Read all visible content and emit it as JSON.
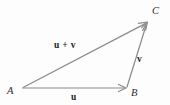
{
  "figure": {
    "background_color": "#fdfdfd",
    "line_color": "#8a8a8a",
    "label_color": "#2b2b2b",
    "width": 170,
    "height": 105
  },
  "vertices": [
    {
      "name": "A",
      "label": "A",
      "x": 22,
      "y": 88,
      "label_x": 8,
      "label_y": 93
    },
    {
      "name": "B",
      "label": "B",
      "x": 127,
      "y": 88,
      "label_x": 131,
      "label_y": 95
    },
    {
      "name": "C",
      "label": "C",
      "x": 148,
      "y": 22,
      "label_x": 153,
      "label_y": 13
    }
  ],
  "vectors": [
    {
      "name": "u",
      "label": "u",
      "from": "A",
      "to": "B",
      "label_x": 74,
      "label_y": 98,
      "arrowhead": "open"
    },
    {
      "name": "v",
      "label": "v",
      "from": "B",
      "to": "C",
      "label_x": 139,
      "label_y": 60,
      "arrowhead": "open"
    },
    {
      "name": "u+v",
      "label": "u + v",
      "from": "A",
      "to": "C",
      "label_x": 56,
      "label_y": 48,
      "arrowhead": "open"
    }
  ],
  "geometry": {
    "u_line": {
      "x1": 22,
      "y1": 88,
      "x2": 125,
      "y2": 88
    },
    "v_line": {
      "x1": 127,
      "y1": 87,
      "x2": 147,
      "y2": 24
    },
    "sum_line": {
      "x1": 24,
      "y1": 87,
      "x2": 146,
      "y2": 23
    }
  }
}
